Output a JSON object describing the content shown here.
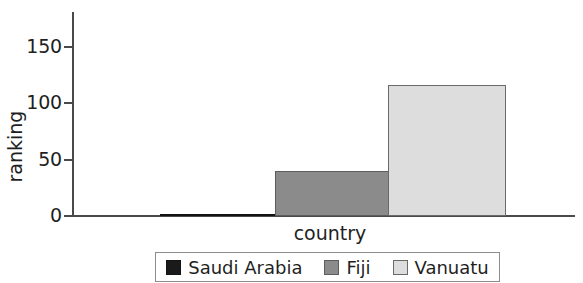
{
  "chart_data": {
    "type": "bar",
    "title": "",
    "subtitle": "",
    "xlabel": "country",
    "ylabel": "ranking",
    "categories": [
      "Saudi Arabia",
      "Fiji",
      "Vanuatu"
    ],
    "values": [
      1,
      40,
      116
    ],
    "series": [
      {
        "name": "ranking",
        "values": [
          1,
          40,
          116
        ]
      }
    ],
    "ylim": [
      0,
      176
    ],
    "yticks": [
      0,
      50,
      100,
      150
    ],
    "ytick_labels": [
      "0",
      "50",
      "100",
      "150"
    ],
    "xticks": [],
    "xtick_labels": [],
    "grid": false,
    "legend": {
      "position": "bottom",
      "entries": [
        {
          "label": "Saudi Arabia",
          "color": "#1a1a1a"
        },
        {
          "label": "Fiji",
          "color": "#8b8b8b"
        },
        {
          "label": "Vanuatu",
          "color": "#dddddd"
        }
      ]
    },
    "annotations": []
  },
  "axes": {
    "y_title": "ranking",
    "x_title": "country",
    "y_tick_labels": [
      "150",
      "100",
      "50",
      "0"
    ]
  },
  "bars": [
    {
      "name": "Saudi Arabia",
      "value": 1,
      "color": "#1a1a1a"
    },
    {
      "name": "Fiji",
      "value": 40,
      "color": "#8b8b8b"
    },
    {
      "name": "Vanuatu",
      "value": 116,
      "color": "#dddddd"
    }
  ]
}
